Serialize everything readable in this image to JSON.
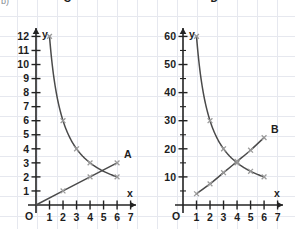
{
  "corner_note": "b)",
  "colors": {
    "axis": "#232323",
    "curve": "#4a4a4a",
    "marker": "#9a9a9a",
    "grid": "#e6e8ef",
    "background": "#ffffff"
  },
  "chart_data": [
    {
      "type": "line",
      "id": "left-chart",
      "title": "",
      "xlabel": "x",
      "ylabel": "y",
      "xlim": [
        0,
        7.4
      ],
      "ylim": [
        0,
        12.6
      ],
      "grid": true,
      "legend": "inline-curve-labels",
      "origin_label": "O",
      "xticks": [
        1,
        2,
        3,
        4,
        5,
        6,
        7
      ],
      "yticks": [
        1,
        2,
        3,
        4,
        5,
        6,
        7,
        8,
        9,
        10,
        11,
        12
      ],
      "xtick_labels": [
        "1",
        "2",
        "3",
        "4",
        "5",
        "6",
        "7"
      ],
      "ytick_labels": [
        "1",
        "2",
        "3",
        "4",
        "5",
        "6",
        "7",
        "8",
        "9",
        "10",
        "11",
        "12"
      ],
      "series": [
        {
          "name": "C",
          "label": "C",
          "kind": "hyperbola",
          "relation": "y = 12 / x",
          "x": [
            1,
            2,
            3,
            4,
            6
          ],
          "values": [
            12,
            6,
            4,
            3,
            2
          ],
          "markers": true
        },
        {
          "name": "A",
          "label": "A",
          "kind": "straight-line",
          "relation": "y = x / 2",
          "x": [
            0,
            2,
            4,
            6
          ],
          "values": [
            0,
            1,
            2,
            3
          ],
          "markers": true
        }
      ]
    },
    {
      "type": "line",
      "id": "right-chart",
      "title": "",
      "xlabel": "x",
      "ylabel": "y",
      "xlim": [
        0,
        7.4
      ],
      "ylim": [
        0,
        63
      ],
      "grid": true,
      "legend": "inline-curve-labels",
      "origin_label": "O",
      "xticks": [
        1,
        2,
        3,
        4,
        5,
        6,
        7
      ],
      "yticks": [
        10,
        20,
        30,
        40,
        50,
        60
      ],
      "yticks_minor": [
        5,
        15,
        25,
        35,
        45,
        55
      ],
      "xtick_labels": [
        "1",
        "2",
        "3",
        "4",
        "5",
        "6",
        "7"
      ],
      "ytick_labels": [
        "10",
        "20",
        "30",
        "40",
        "50",
        "60"
      ],
      "series": [
        {
          "name": "D",
          "label": "D",
          "kind": "hyperbola",
          "relation": "y = 60 / x",
          "x": [
            1,
            2,
            3,
            4,
            5,
            6
          ],
          "values": [
            60,
            30,
            20,
            15,
            12,
            10
          ],
          "markers": true
        },
        {
          "name": "B",
          "label": "B",
          "kind": "increasing-curve",
          "x": [
            1,
            2,
            3,
            4,
            5,
            6
          ],
          "values": [
            4,
            7.5,
            11.5,
            15.5,
            19.5,
            24
          ],
          "markers": true
        }
      ]
    }
  ]
}
